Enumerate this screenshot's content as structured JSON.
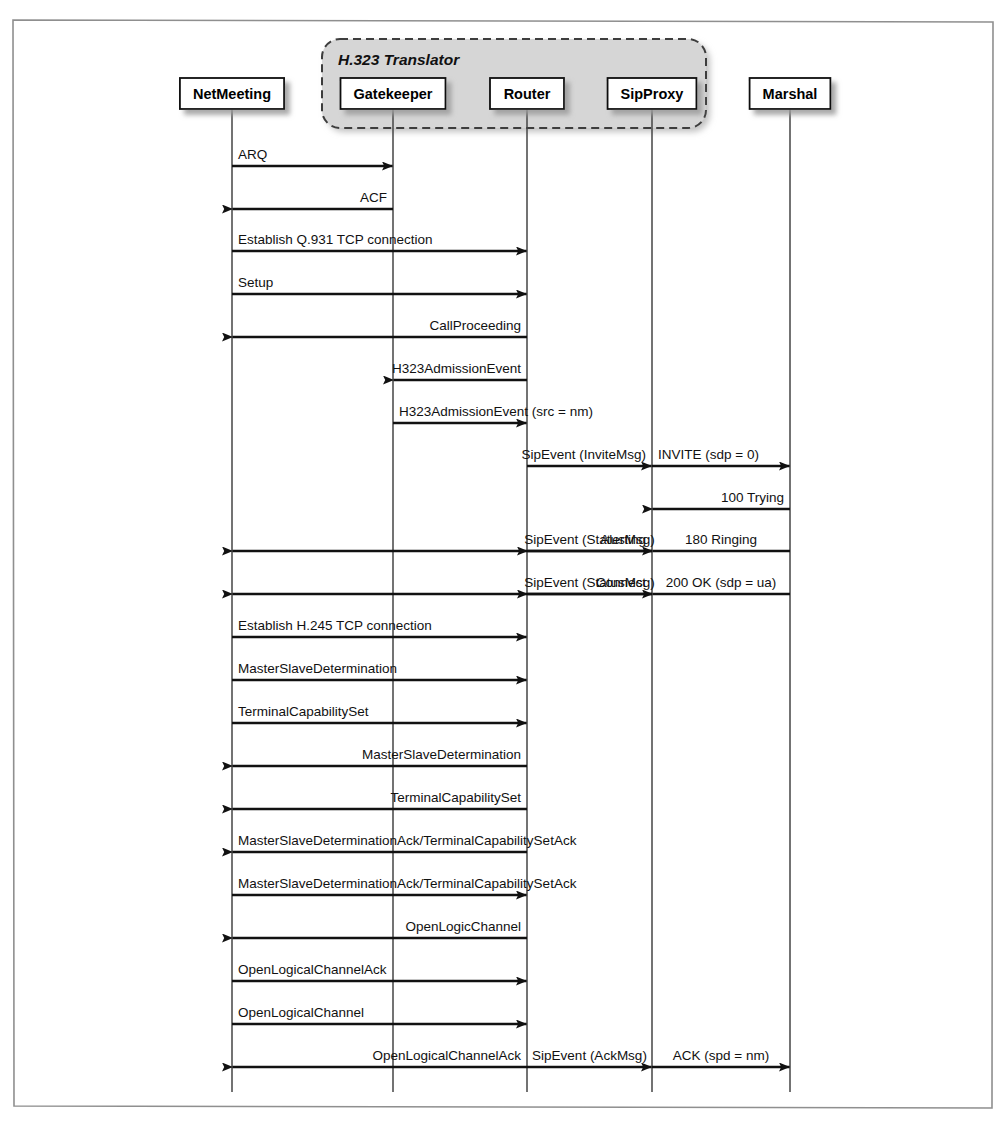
{
  "figure": {
    "type": "sequence-diagram"
  },
  "group": {
    "label": "H.323 Translator",
    "members": [
      "Gatekeeper",
      "Router",
      "SipProxy"
    ],
    "fill": "#d4d4d4",
    "border": "#3a3a3a"
  },
  "lifelines": [
    {
      "id": "nm",
      "label": "NetMeeting",
      "x": 232
    },
    {
      "id": "gk",
      "label": "Gatekeeper",
      "x": 393
    },
    {
      "id": "rt",
      "label": "Router",
      "x": 527
    },
    {
      "id": "sp",
      "label": "SipProxy",
      "x": 652
    },
    {
      "id": "ms",
      "label": "Marshal",
      "x": 790
    }
  ],
  "messages": [
    {
      "label": "ARQ",
      "from": "nm",
      "to": "gk",
      "dir": "right",
      "y": 166,
      "align": "left"
    },
    {
      "label": "ACF",
      "from": "gk",
      "to": "nm",
      "dir": "left",
      "y": 209,
      "align": "right"
    },
    {
      "label": "Establish Q.931 TCP connection",
      "from": "nm",
      "to": "rt",
      "dir": "right",
      "y": 251,
      "align": "left"
    },
    {
      "label": "Setup",
      "from": "nm",
      "to": "rt",
      "dir": "right",
      "y": 294,
      "align": "left"
    },
    {
      "label": "CallProceeding",
      "from": "rt",
      "to": "nm",
      "dir": "left",
      "y": 337,
      "align": "right"
    },
    {
      "label": "H323AdmissionEvent",
      "from": "rt",
      "to": "gk",
      "dir": "left",
      "y": 380,
      "align": "right"
    },
    {
      "label": "H323AdmissionEvent (src = nm)",
      "from": "gk",
      "to": "rt",
      "dir": "right",
      "y": 423,
      "align": "left"
    },
    {
      "label": "SipEvent (InviteMsg)",
      "from": "rt",
      "to": "sp",
      "dir": "right",
      "y": 466,
      "align": "right"
    },
    {
      "label": "INVITE (sdp = 0)",
      "from": "sp",
      "to": "ms",
      "dir": "right",
      "y": 466,
      "align": "left"
    },
    {
      "label": "100 Trying",
      "from": "ms",
      "to": "sp",
      "dir": "left",
      "y": 509,
      "align": "right"
    },
    {
      "label": "Alerting",
      "from": "sp",
      "to": "nm",
      "dir": "left",
      "y": 551,
      "align": "right"
    },
    {
      "label": "SipEvent (StatusMsg)",
      "from": "sp",
      "to": "rt",
      "dir": "left",
      "y": 551,
      "align": "center"
    },
    {
      "label": "180 Ringing",
      "from": "ms",
      "to": "sp",
      "dir": "left",
      "y": 551,
      "align": "center"
    },
    {
      "label": "Connect",
      "from": "sp",
      "to": "nm",
      "dir": "left",
      "y": 594,
      "align": "right"
    },
    {
      "label": "SipEvent (StatusMsg)",
      "from": "sp",
      "to": "rt",
      "dir": "left",
      "y": 594,
      "align": "center"
    },
    {
      "label": "200 OK (sdp = ua)",
      "from": "ms",
      "to": "sp",
      "dir": "left",
      "y": 594,
      "align": "center"
    },
    {
      "label": "Establish H.245 TCP connection",
      "from": "nm",
      "to": "rt",
      "dir": "right",
      "y": 637,
      "align": "left"
    },
    {
      "label": "MasterSlaveDetermination",
      "from": "nm",
      "to": "rt",
      "dir": "right",
      "y": 680,
      "align": "left"
    },
    {
      "label": "TerminalCapabilitySet",
      "from": "nm",
      "to": "rt",
      "dir": "right",
      "y": 723,
      "align": "left"
    },
    {
      "label": "MasterSlaveDetermination",
      "from": "rt",
      "to": "nm",
      "dir": "left",
      "y": 766,
      "align": "right"
    },
    {
      "label": "TerminalCapabilitySet",
      "from": "rt",
      "to": "nm",
      "dir": "left",
      "y": 809,
      "align": "right"
    },
    {
      "label": "MasterSlaveDeterminationAck/TerminalCapabilitySetAck",
      "from": "rt",
      "to": "nm",
      "dir": "left",
      "y": 852,
      "align": "left"
    },
    {
      "label": "MasterSlaveDeterminationAck/TerminalCapabilitySetAck",
      "from": "nm",
      "to": "rt",
      "dir": "right",
      "y": 895,
      "align": "left"
    },
    {
      "label": "OpenLogicChannel",
      "from": "rt",
      "to": "nm",
      "dir": "left",
      "y": 938,
      "align": "right"
    },
    {
      "label": "OpenLogicalChannelAck",
      "from": "nm",
      "to": "rt",
      "dir": "right",
      "y": 981,
      "align": "left"
    },
    {
      "label": "OpenLogicalChannel",
      "from": "nm",
      "to": "rt",
      "dir": "right",
      "y": 1024,
      "align": "left"
    },
    {
      "label": "OpenLogicalChannelAck",
      "from": "rt",
      "to": "nm",
      "dir": "left",
      "y": 1067,
      "align": "right"
    },
    {
      "label": "SipEvent (AckMsg)",
      "from": "rt",
      "to": "sp",
      "dir": "right",
      "y": 1067,
      "align": "center"
    },
    {
      "label": "ACK (spd = nm)",
      "from": "sp",
      "to": "ms",
      "dir": "right",
      "y": 1067,
      "align": "center"
    }
  ],
  "colors": {
    "ink": "#111111",
    "frame": "#8a8a8a",
    "shadow": "#b0b0b0",
    "lifeline": "#444444"
  }
}
